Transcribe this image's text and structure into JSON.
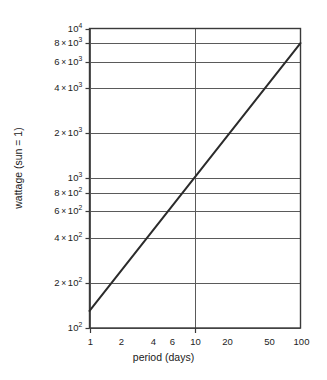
{
  "chart_data": {
    "type": "line",
    "title": "",
    "xlabel": "period (days)",
    "ylabel": "wattage (sun = 1)",
    "xscale": "log",
    "yscale": "log",
    "xlim": [
      1,
      100
    ],
    "ylim": [
      100,
      10000
    ],
    "grid": true,
    "legend": "none",
    "xticks": [
      {
        "value": 1,
        "label": "1",
        "tick_mark": true,
        "gridline": true
      },
      {
        "value": 2,
        "label": "2",
        "tick_mark": false,
        "gridline": false
      },
      {
        "value": 4,
        "label": "4",
        "tick_mark": false,
        "gridline": false
      },
      {
        "value": 6,
        "label": "6",
        "tick_mark": false,
        "gridline": false
      },
      {
        "value": 10,
        "label": "10",
        "tick_mark": true,
        "gridline": true
      },
      {
        "value": 20,
        "label": "20",
        "tick_mark": false,
        "gridline": false
      },
      {
        "value": 50,
        "label": "50",
        "tick_mark": false,
        "gridline": false
      },
      {
        "value": 100,
        "label": "100",
        "tick_mark": false,
        "gridline": false
      }
    ],
    "yticks": [
      {
        "value": 10000,
        "mantissa": "",
        "exponent": "4",
        "base": "10",
        "gridline": true
      },
      {
        "value": 8000,
        "mantissa": "8",
        "exponent": "3",
        "base": "10",
        "gridline": true
      },
      {
        "value": 6000,
        "mantissa": "6",
        "exponent": "3",
        "base": "10",
        "gridline": true
      },
      {
        "value": 4000,
        "mantissa": "4",
        "exponent": "3",
        "base": "10",
        "gridline": true
      },
      {
        "value": 2000,
        "mantissa": "2",
        "exponent": "3",
        "base": "10",
        "gridline": true
      },
      {
        "value": 1000,
        "mantissa": "",
        "exponent": "3",
        "base": "10",
        "gridline": true
      },
      {
        "value": 800,
        "mantissa": "8",
        "exponent": "2",
        "base": "10",
        "gridline": true
      },
      {
        "value": 600,
        "mantissa": "6",
        "exponent": "2",
        "base": "10",
        "gridline": true
      },
      {
        "value": 400,
        "mantissa": "4",
        "exponent": "2",
        "base": "10",
        "gridline": true
      },
      {
        "value": 200,
        "mantissa": "2",
        "exponent": "2",
        "base": "10",
        "gridline": true
      },
      {
        "value": 100,
        "mantissa": "",
        "exponent": "2",
        "base": "10",
        "gridline": true
      }
    ],
    "series": [
      {
        "name": "wattage vs period",
        "points": [
          {
            "x": 1,
            "y": 130
          },
          {
            "x": 100,
            "y": 8000
          }
        ],
        "color": "#2b2b2b",
        "width": 2.0
      }
    ]
  },
  "style": {
    "axis_color": "#3a3a3a",
    "grid_color": "#5a5a5a",
    "line_color": "#2b2b2b",
    "background": "#ffffff",
    "text_color": "#1a1a1a"
  },
  "multiply_symbol": "×"
}
